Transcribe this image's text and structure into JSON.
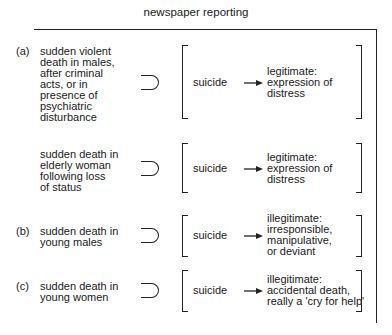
{
  "title": "newspaper reporting",
  "rows": [
    {
      "label": "(a)",
      "condition": "sudden violent\ndeath in males,\nafter criminal\nacts, or in\npresence of\npsychiatric\ndisturbance",
      "symbol": "superset",
      "verdict": "suicide",
      "result": "legitimate:\nexpression of\ndistress"
    },
    {
      "label": "",
      "condition": "sudden death in\nelderly woman\nfollowing loss\nof status",
      "symbol": "superset",
      "verdict": "suicide",
      "result": "legitimate:\nexpression of\ndistress"
    },
    {
      "label": "(b)",
      "condition": "sudden death in\nyoung males",
      "symbol": "superset",
      "verdict": "suicide",
      "result": "illegitimate:\nirresponsible,\nmanipulative,\nor deviant"
    },
    {
      "label": "(c)",
      "condition": "sudden death in\nyoung women",
      "symbol": "superset",
      "verdict": "suicide",
      "result": "illegitimate:\naccidental death,\nreally a 'cry for help'"
    }
  ]
}
